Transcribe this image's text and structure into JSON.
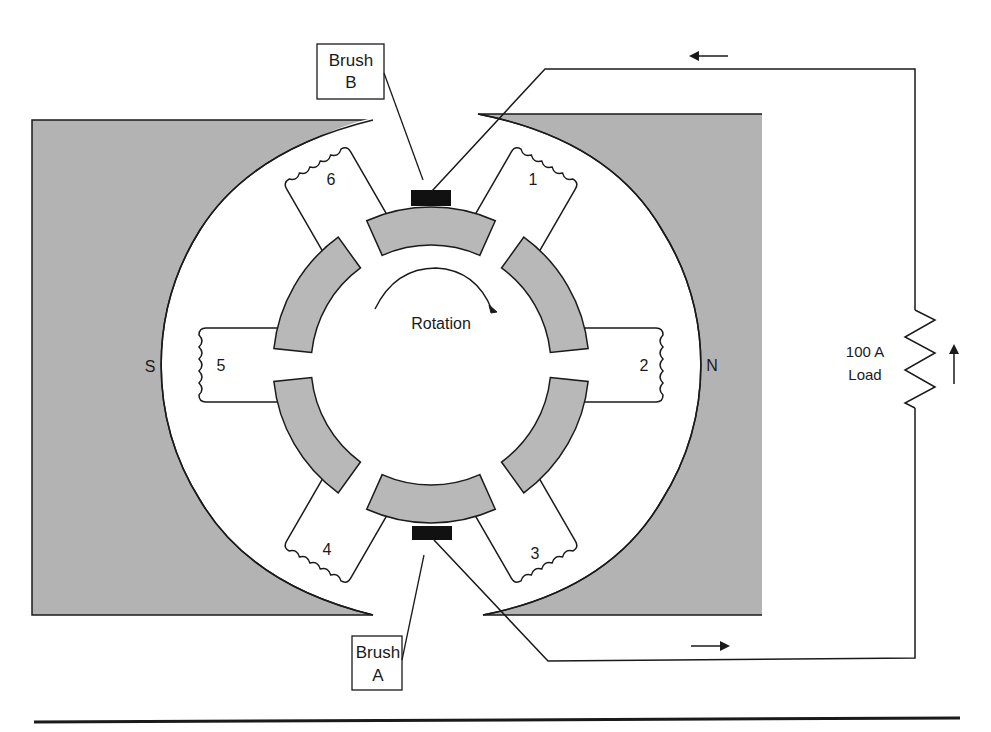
{
  "diagram": {
    "type": "dc-generator-armature-commutator",
    "colors": {
      "pole_fill": "#b3b3b3",
      "segment_fill": "#b8b8b8",
      "brush_fill": "#111111",
      "line": "#1a1a1a",
      "background": "#ffffff"
    },
    "poles": {
      "south_label": "S",
      "north_label": "N"
    },
    "coils": [
      {
        "id": "coil-1",
        "label": "1",
        "angle_deg": 60
      },
      {
        "id": "coil-2",
        "label": "2",
        "angle_deg": 0
      },
      {
        "id": "coil-3",
        "label": "3",
        "angle_deg": -60
      },
      {
        "id": "coil-4",
        "label": "4",
        "angle_deg": -120
      },
      {
        "id": "coil-5",
        "label": "5",
        "angle_deg": 180
      },
      {
        "id": "coil-6",
        "label": "6",
        "angle_deg": 120
      }
    ],
    "commutator_segments": 6,
    "rotation_label": "Rotation",
    "brushes": {
      "top": {
        "line1": "Brush",
        "line2": "B"
      },
      "bottom": {
        "line1": "Brush",
        "line2": "A"
      }
    },
    "load": {
      "line1": "100 A",
      "line2": "Load"
    },
    "current_arrows": [
      "left (top wire)",
      "right (bottom wire)",
      "up (beside load)"
    ]
  }
}
